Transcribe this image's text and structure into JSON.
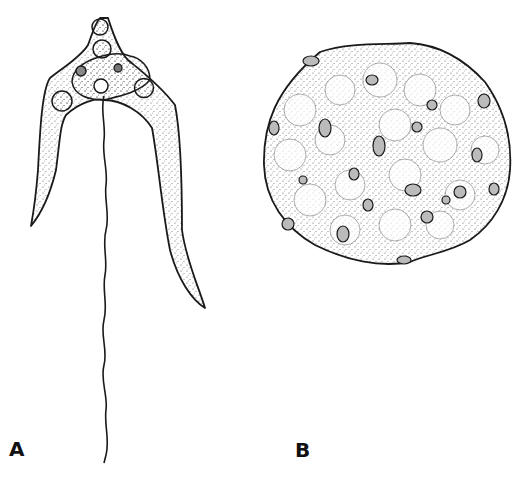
{
  "figure": {
    "panels": [
      {
        "id": "A",
        "label": "A",
        "subject": "flagellate trypanosome-like cell with two curved arms and long wavy flagellum"
      },
      {
        "id": "B",
        "label": "B",
        "subject": "rounded stippled cell mass containing scattered small nuclei"
      }
    ],
    "colors": {
      "ink": "#1a1a1a",
      "stipple": "#555555",
      "background": "#ffffff"
    }
  }
}
